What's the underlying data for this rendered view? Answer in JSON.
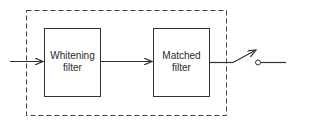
{
  "diagram": {
    "blocks": [
      {
        "id": "whitening",
        "line1": "Whitening",
        "line2": "filter"
      },
      {
        "id": "matched",
        "line1": "Matched",
        "line2": "filter"
      }
    ],
    "enclosure": "dashed",
    "output": "sampling-switch"
  }
}
